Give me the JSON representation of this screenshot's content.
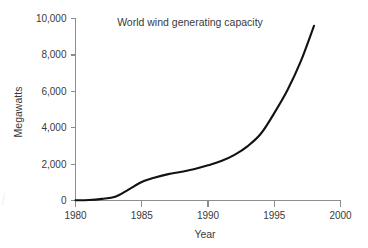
{
  "chart_data": {
    "type": "line",
    "title": "World wind generating capacity",
    "xlabel": "Year",
    "ylabel": "Megawatts",
    "xlim": [
      1980,
      2000
    ],
    "ylim": [
      0,
      10000
    ],
    "grid": false,
    "legend": null,
    "line_color": "#121212",
    "axis_color": "#8d8d8d",
    "text_color": "#3a3a3a",
    "background_color": "#ffffff",
    "x_ticks": [
      1980,
      1985,
      1990,
      1995,
      2000
    ],
    "x_tick_labels": [
      "1980",
      "1985",
      "1990",
      "1995",
      "2000"
    ],
    "y_ticks": [
      0,
      2000,
      4000,
      6000,
      8000,
      10000
    ],
    "y_tick_labels": [
      "0",
      "2,000",
      "4,000",
      "6,000",
      "8,000",
      "10,000"
    ],
    "series": [
      {
        "name": "World wind generating capacity",
        "x": [
          1980,
          1981,
          1982,
          1983,
          1984,
          1985,
          1986,
          1987,
          1988,
          1989,
          1990,
          1991,
          1992,
          1993,
          1994,
          1995,
          1996,
          1997,
          1998
        ],
        "values": [
          10,
          25,
          90,
          210,
          600,
          1020,
          1270,
          1450,
          1580,
          1730,
          1930,
          2170,
          2510,
          2990,
          3680,
          4800,
          6070,
          7640,
          9600
        ]
      }
    ]
  },
  "labels": {
    "title": "World wind generating capacity",
    "x_axis_title": "Year",
    "y_axis_title": "Megawatts"
  }
}
